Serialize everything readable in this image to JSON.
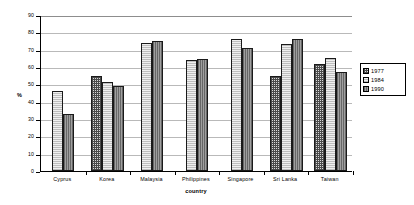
{
  "chart_data": {
    "type": "bar",
    "title": "",
    "xlabel": "country",
    "ylabel": "%",
    "ylim": [
      0,
      90
    ],
    "ytick_step": 10,
    "yticks": [
      0,
      10,
      20,
      30,
      40,
      50,
      60,
      70,
      80,
      90
    ],
    "grid": true,
    "legend_position": "right",
    "categories": [
      "Cyprus",
      "Korea",
      "Malaysia",
      "Philippines",
      "Singapore",
      "Sri Lanka",
      "Taiwan"
    ],
    "series": [
      {
        "name": "1977",
        "swatch": "cross-hatch",
        "color": "#d9d9d9",
        "values": [
          null,
          55,
          null,
          null,
          null,
          55,
          62
        ]
      },
      {
        "name": "1984",
        "swatch": "light-stipple",
        "color": "#efefef",
        "values": [
          46,
          51.5,
          74,
          64,
          76,
          73,
          65
        ]
      },
      {
        "name": "1990",
        "swatch": "dark-solid",
        "color": "#8a8a8a",
        "values": [
          33,
          49,
          75,
          64.5,
          71,
          76,
          57
        ]
      }
    ]
  },
  "axes": {
    "y_label": "%",
    "x_label": "country",
    "y_ticks": [
      "90",
      "80",
      "70",
      "60",
      "50",
      "40",
      "30",
      "20",
      "10",
      "0"
    ]
  },
  "legend": {
    "entries": [
      {
        "label": "1977"
      },
      {
        "label": "1984"
      },
      {
        "label": "1990"
      }
    ]
  }
}
